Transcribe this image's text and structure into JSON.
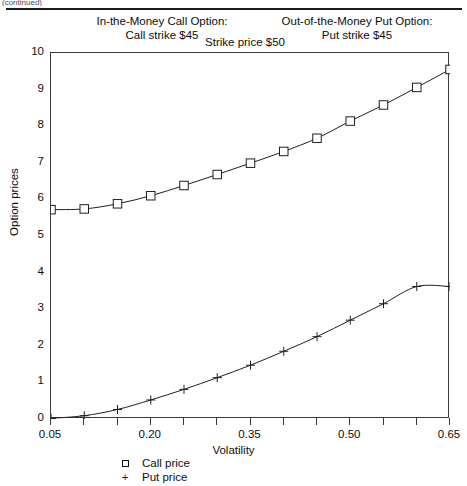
{
  "page": {
    "scan_fragment": "(continued)"
  },
  "annotations": {
    "call_option": {
      "line1": "In-the-Money Call Option:",
      "line2": "Call strike    $45"
    },
    "put_option": {
      "line1": "Out-of-the-Money Put Option:",
      "line2": "Put strike    $45"
    },
    "strike_price": {
      "line1": "Strike price    $50"
    }
  },
  "legend": {
    "position": "below-axis",
    "entries": [
      {
        "symbol": "square",
        "label": "Call price"
      },
      {
        "symbol": "plus",
        "label": "Put price"
      }
    ]
  },
  "chart_data": {
    "type": "line",
    "title": "",
    "xlabel": "Volatility",
    "ylabel": "Option prices",
    "xlim": [
      0.05,
      0.65
    ],
    "ylim": [
      0,
      10
    ],
    "grid": false,
    "xticks": [
      0.05,
      0.1,
      0.15,
      0.2,
      0.25,
      0.3,
      0.35,
      0.4,
      0.45,
      0.5,
      0.55,
      0.6,
      0.65
    ],
    "xtick_labels": [
      "0.05",
      "",
      "",
      "0.20",
      "",
      "",
      "0.35",
      "",
      "",
      "0.50",
      "",
      "",
      "0.65"
    ],
    "yticks": [
      0,
      1,
      2,
      3,
      4,
      5,
      6,
      7,
      8,
      9,
      10
    ],
    "ytick_labels": [
      "0",
      "1",
      "2",
      "3",
      "4",
      "5",
      "6",
      "7",
      "8",
      "9",
      "10"
    ],
    "x": [
      0.05,
      0.1,
      0.15,
      0.2,
      0.25,
      0.3,
      0.35,
      0.4,
      0.45,
      0.5,
      0.55,
      0.6,
      0.65
    ],
    "series": [
      {
        "name": "Call price",
        "marker": "square",
        "values": [
          5.72,
          5.74,
          5.88,
          6.1,
          6.38,
          6.68,
          6.99,
          7.31,
          7.67,
          8.14,
          8.58,
          9.06,
          9.55
        ]
      },
      {
        "name": "Put price",
        "marker": "plus",
        "values": [
          0.02,
          0.09,
          0.26,
          0.52,
          0.81,
          1.13,
          1.47,
          1.85,
          2.25,
          2.7,
          3.15,
          3.62,
          3.62
        ]
      }
    ]
  }
}
